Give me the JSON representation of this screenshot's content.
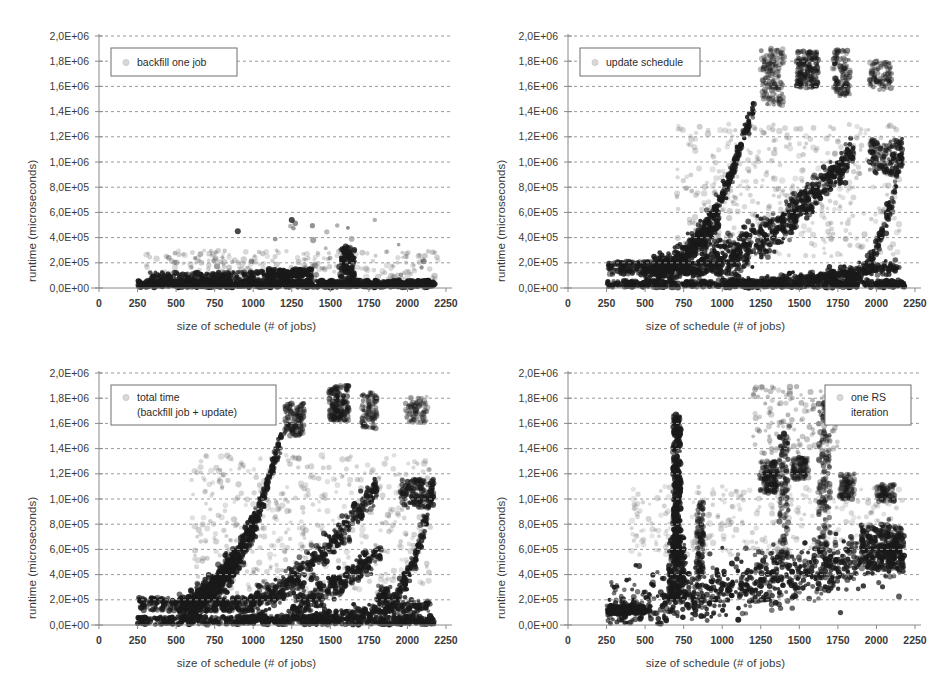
{
  "figure": {
    "panel_count": 4,
    "background": "#ffffff"
  },
  "axes": {
    "xlabel": "size of schedule (# of jobs)",
    "ylabel": "runtime (microseconds)",
    "x_ticks": [
      "0",
      "250",
      "500",
      "750",
      "1000",
      "1250",
      "1500",
      "1750",
      "2000",
      "2250"
    ],
    "x_tick_values": [
      0,
      250,
      500,
      750,
      1000,
      1250,
      1500,
      1750,
      2000,
      2250
    ],
    "y_ticks": [
      "0,0E+00",
      "2,0E+05",
      "4,0E+05",
      "6,0E+05",
      "8,0E+05",
      "1,0E+06",
      "1,2E+06",
      "1,4E+06",
      "1,6E+06",
      "1,8E+06",
      "2,0E+06"
    ],
    "y_tick_values": [
      0,
      200000,
      400000,
      600000,
      800000,
      1000000,
      1200000,
      1400000,
      1600000,
      1800000,
      2000000
    ],
    "xlim": [
      0,
      2250
    ],
    "ylim": [
      0,
      2000000
    ],
    "grid": "horizontal-dashed",
    "marker_color": "#1a1a1a",
    "grid_color": "#9a9a9a",
    "axis_color": "#8a8a8a"
  },
  "panels": [
    {
      "id": "backfill-one-job",
      "legend_lines": [
        "backfill one job"
      ],
      "legend_position": "top-left"
    },
    {
      "id": "update-schedule",
      "legend_lines": [
        "update schedule"
      ],
      "legend_position": "top-left"
    },
    {
      "id": "total-time",
      "legend_lines": [
        "total time",
        "(backfill job + update)"
      ],
      "legend_position": "top-left"
    },
    {
      "id": "one-rs-iteration",
      "legend_lines": [
        "one RS",
        "iteration"
      ],
      "legend_position": "top-right"
    }
  ],
  "chart_data": [
    {
      "type": "scatter",
      "id": "backfill-one-job",
      "title": "backfill one job",
      "xlabel": "size of schedule (# of jobs)",
      "ylabel": "runtime (microseconds)",
      "xlim": [
        0,
        2250
      ],
      "ylim": [
        0,
        2000000
      ],
      "grid": true,
      "legend": [
        "backfill one job"
      ],
      "legend_position": "top-left",
      "description": "Dense near-zero band of points from x=250 to x=2180 staying below 1.5E+05, with a sparse haze of outliers up to 3E+05 and isolated outliers at (900, 4.5E+05), (1250, 5.4E+05), (500, 1.2E+05); a denser vertical cluster near x=1600 reaching 3.3E+05.",
      "clusters": [
        {
          "name": "baseline-band",
          "x_range": [
            250,
            2180
          ],
          "y_range": [
            5000,
            60000
          ],
          "n": 900,
          "opacity": 0.95
        },
        {
          "name": "low-ridge",
          "x_range": [
            330,
            1350
          ],
          "y_range": [
            20000,
            130000
          ],
          "n": 320,
          "opacity": 0.85
        },
        {
          "name": "step-1250",
          "x_range": [
            1100,
            1380
          ],
          "y_range": [
            90000,
            150000
          ],
          "n": 120,
          "opacity": 0.9
        },
        {
          "name": "spike-1600",
          "x_range": [
            1560,
            1660
          ],
          "y_range": [
            60000,
            330000
          ],
          "n": 110,
          "opacity": 0.85
        },
        {
          "name": "haze",
          "x_range": [
            300,
            2200
          ],
          "y_range": [
            40000,
            300000
          ],
          "n": 260,
          "opacity": 0.22
        },
        {
          "name": "outliers",
          "x_range": [
            450,
            2150
          ],
          "y_range": [
            100000,
            560000
          ],
          "n": 26,
          "opacity": 0.5
        }
      ],
      "notable_points": [
        [
          900,
          450000
        ],
        [
          1250,
          540000
        ],
        [
          500,
          120000
        ],
        [
          1600,
          330000
        ]
      ]
    },
    {
      "type": "scatter",
      "id": "update-schedule",
      "title": "update schedule",
      "xlabel": "size of schedule (# of jobs)",
      "ylabel": "runtime (microseconds)",
      "xlim": [
        0,
        2250
      ],
      "ylim": [
        0,
        2000000
      ],
      "grid": true,
      "legend": [
        "update schedule"
      ],
      "legend_position": "top-left",
      "description": "Several rising curved ridges from x=250 upward. Steepest ridge climbs from (600,2E+05) to (1200,1.45E+06). A second ridge rises to 1.05E+06 near x=1800 then to 1.15E+06 at x=2150. A near-zero flat band runs the full width. Dense high-altitude clusters between 1.55E+06 and 1.9E+06 sit between x=1250 and x=2100.",
      "ridges": [
        {
          "name": "steep-ridge",
          "x0": 560,
          "y0": 150000,
          "x1": 1205,
          "y1": 1460000,
          "power": 2.1,
          "n": 340,
          "spread": 45000
        },
        {
          "name": "mid-ridge",
          "x0": 470,
          "y0": 120000,
          "x1": 1850,
          "y1": 1070000,
          "power": 1.8,
          "n": 420,
          "spread": 60000
        },
        {
          "name": "mid-ridge-2",
          "x0": 950,
          "y0": 150000,
          "x1": 1830,
          "y1": 1050000,
          "power": 1.5,
          "n": 300,
          "spread": 55000
        },
        {
          "name": "low-ridge",
          "x0": 560,
          "y0": 150000,
          "x1": 980,
          "y1": 530000,
          "power": 1.4,
          "n": 220,
          "spread": 40000
        },
        {
          "name": "tail-ridge",
          "x0": 1700,
          "y0": 60000,
          "x1": 2170,
          "y1": 1140000,
          "power": 3.2,
          "n": 180,
          "spread": 45000
        },
        {
          "name": "shallow-ridge",
          "x0": 1050,
          "y0": 30000,
          "x1": 2150,
          "y1": 170000,
          "power": 1.3,
          "n": 300,
          "spread": 25000
        }
      ],
      "clusters": [
        {
          "name": "baseline",
          "x_range": [
            250,
            2180
          ],
          "y_range": [
            3000,
            60000
          ],
          "n": 520,
          "opacity": 0.9
        },
        {
          "name": "plateau-200k",
          "x_range": [
            260,
            1000
          ],
          "y_range": [
            110000,
            210000
          ],
          "n": 260,
          "opacity": 0.8
        },
        {
          "name": "high-cluster-1300",
          "x_range": [
            1250,
            1400
          ],
          "y_range": [
            1450000,
            1900000
          ],
          "n": 140,
          "opacity": 0.45
        },
        {
          "name": "high-cluster-1550",
          "x_range": [
            1480,
            1620
          ],
          "y_range": [
            1580000,
            1880000
          ],
          "n": 150,
          "opacity": 0.6
        },
        {
          "name": "high-cluster-1780",
          "x_range": [
            1720,
            1830
          ],
          "y_range": [
            1520000,
            1900000
          ],
          "n": 110,
          "opacity": 0.5
        },
        {
          "name": "high-cluster-2000",
          "x_range": [
            1950,
            2100
          ],
          "y_range": [
            1570000,
            1800000
          ],
          "n": 90,
          "opacity": 0.45
        },
        {
          "name": "mid-haze",
          "x_range": [
            700,
            2150
          ],
          "y_range": [
            250000,
            1300000
          ],
          "n": 420,
          "opacity": 0.2
        },
        {
          "name": "cluster-2000-1e6",
          "x_range": [
            1950,
            2170
          ],
          "y_range": [
            900000,
            1180000
          ],
          "n": 120,
          "opacity": 0.75
        }
      ],
      "notable_points": [
        [
          1205,
          1460000
        ],
        [
          1830,
          1060000
        ],
        [
          2160,
          1150000
        ]
      ]
    },
    {
      "type": "scatter",
      "id": "total-time",
      "title": "total time (backfill job + update)",
      "xlabel": "size of schedule (# of jobs)",
      "ylabel": "runtime (microseconds)",
      "xlim": [
        0,
        2250
      ],
      "ylim": [
        0,
        2000000
      ],
      "grid": true,
      "legend": [
        "total time",
        "(backfill job + update)"
      ],
      "legend_position": "top-left",
      "description": "Similar to update schedule but shifted left and denser. Steep ridge climbs from (600,2E+05) to (1180,1.48E+06). Multiple intermediate ridges fan out between x=600 and x=1900 reaching 0.6E+06 to 1.1E+06. Flat near-zero band spans full width. High clusters between 1.6E+06 and 1.9E+06 appear at x=1250, 1500-1600, 1750 and 2000-2150.",
      "ridges": [
        {
          "name": "steep-ridge",
          "x0": 560,
          "y0": 160000,
          "x1": 1180,
          "y1": 1490000,
          "power": 2.2,
          "n": 360,
          "spread": 45000
        },
        {
          "name": "fan-a",
          "x0": 520,
          "y0": 130000,
          "x1": 1020,
          "y1": 830000,
          "power": 1.6,
          "n": 300,
          "spread": 55000
        },
        {
          "name": "fan-b",
          "x0": 600,
          "y0": 150000,
          "x1": 900,
          "y1": 560000,
          "power": 1.4,
          "n": 240,
          "spread": 45000
        },
        {
          "name": "fan-c",
          "x0": 980,
          "y0": 180000,
          "x1": 1800,
          "y1": 1080000,
          "power": 1.5,
          "n": 380,
          "spread": 60000
        },
        {
          "name": "fan-d",
          "x0": 1250,
          "y0": 150000,
          "x1": 1830,
          "y1": 600000,
          "power": 1.4,
          "n": 260,
          "spread": 50000
        },
        {
          "name": "tail-ridge",
          "x0": 1800,
          "y0": 200000,
          "x1": 2170,
          "y1": 1130000,
          "power": 2.6,
          "n": 170,
          "spread": 45000
        },
        {
          "name": "shallow-ridge",
          "x0": 900,
          "y0": 30000,
          "x1": 2150,
          "y1": 160000,
          "power": 1.3,
          "n": 320,
          "spread": 25000
        }
      ],
      "clusters": [
        {
          "name": "baseline",
          "x_range": [
            250,
            2180
          ],
          "y_range": [
            3000,
            70000
          ],
          "n": 500,
          "opacity": 0.9
        },
        {
          "name": "plateau-200k",
          "x_range": [
            260,
            1000
          ],
          "y_range": [
            110000,
            220000
          ],
          "n": 280,
          "opacity": 0.8
        },
        {
          "name": "high-cluster-1250",
          "x_range": [
            1200,
            1330
          ],
          "y_range": [
            1500000,
            1760000
          ],
          "n": 130,
          "opacity": 0.5
        },
        {
          "name": "high-cluster-1560",
          "x_range": [
            1490,
            1620
          ],
          "y_range": [
            1620000,
            1900000
          ],
          "n": 150,
          "opacity": 0.6
        },
        {
          "name": "high-cluster-1750",
          "x_range": [
            1700,
            1800
          ],
          "y_range": [
            1560000,
            1850000
          ],
          "n": 100,
          "opacity": 0.45
        },
        {
          "name": "high-cluster-2050",
          "x_range": [
            1980,
            2130
          ],
          "y_range": [
            1600000,
            1820000
          ],
          "n": 80,
          "opacity": 0.4
        },
        {
          "name": "mid-haze",
          "x_range": [
            600,
            2150
          ],
          "y_range": [
            250000,
            1350000
          ],
          "n": 460,
          "opacity": 0.2
        },
        {
          "name": "cluster-2000-1e6",
          "x_range": [
            1950,
            2170
          ],
          "y_range": [
            930000,
            1160000
          ],
          "n": 120,
          "opacity": 0.75
        }
      ],
      "notable_points": [
        [
          1180,
          1490000
        ],
        [
          1800,
          1080000
        ],
        [
          2160,
          1140000
        ]
      ]
    },
    {
      "type": "scatter",
      "id": "one-rs-iteration",
      "title": "one RS iteration",
      "xlabel": "size of schedule (# of jobs)",
      "ylabel": "runtime (microseconds)",
      "xlim": [
        0,
        2250
      ],
      "ylim": [
        0,
        2000000
      ],
      "grid": true,
      "legend": [
        "one RS",
        "iteration"
      ],
      "legend_position": "top-right",
      "description": "A broad elevated band between 2E+05 and 6E+05 spanning x=250 to x=2180, slowly trending upward. A striking narrow vertical spike at x=700 rises from 5E+05 to 1.67E+06. Additional vertical columns near x=850, x=1400 and x=1650-1700 reach 1.0E+06 to 1.3E+06. Scattered high outliers up to 1.9E+06 between x=1250 and x=1700.",
      "ridges": [
        {
          "name": "main-band",
          "x0": 250,
          "y0": 110000,
          "x1": 2180,
          "y1": 600000,
          "power": 1.15,
          "n": 900,
          "spread": 110000
        }
      ],
      "clusters": [
        {
          "name": "left-flat",
          "x_range": [
            250,
            500
          ],
          "y_range": [
            90000,
            150000
          ],
          "n": 180,
          "opacity": 0.9
        },
        {
          "name": "spike-700",
          "x_range": [
            680,
            730
          ],
          "y_range": [
            480000,
            1670000
          ],
          "n": 320,
          "opacity": 0.85
        },
        {
          "name": "spike-700-base",
          "x_range": [
            650,
            760
          ],
          "y_range": [
            200000,
            700000
          ],
          "n": 200,
          "opacity": 0.8
        },
        {
          "name": "column-850",
          "x_range": [
            830,
            880
          ],
          "y_range": [
            350000,
            980000
          ],
          "n": 90,
          "opacity": 0.7
        },
        {
          "name": "column-1400",
          "x_range": [
            1370,
            1430
          ],
          "y_range": [
            500000,
            1520000
          ],
          "n": 120,
          "opacity": 0.6
        },
        {
          "name": "column-1650",
          "x_range": [
            1620,
            1700
          ],
          "y_range": [
            600000,
            1760000
          ],
          "n": 140,
          "opacity": 0.55
        },
        {
          "name": "cluster-1300",
          "x_range": [
            1240,
            1360
          ],
          "y_range": [
            1050000,
            1300000
          ],
          "n": 130,
          "opacity": 0.6
        },
        {
          "name": "cluster-1500",
          "x_range": [
            1450,
            1560
          ],
          "y_range": [
            1150000,
            1330000
          ],
          "n": 100,
          "opacity": 0.55
        },
        {
          "name": "cluster-1800",
          "x_range": [
            1760,
            1860
          ],
          "y_range": [
            1000000,
            1200000
          ],
          "n": 90,
          "opacity": 0.5
        },
        {
          "name": "cluster-2050",
          "x_range": [
            2000,
            2120
          ],
          "y_range": [
            980000,
            1120000
          ],
          "n": 80,
          "opacity": 0.5
        },
        {
          "name": "rise-tail",
          "x_range": [
            1900,
            2180
          ],
          "y_range": [
            450000,
            800000
          ],
          "n": 220,
          "opacity": 0.8
        },
        {
          "name": "high-haze",
          "x_range": [
            1200,
            1750
          ],
          "y_range": [
            1350000,
            1900000
          ],
          "n": 120,
          "opacity": 0.3
        },
        {
          "name": "mid-haze",
          "x_range": [
            400,
            2180
          ],
          "y_range": [
            550000,
            1100000
          ],
          "n": 300,
          "opacity": 0.18
        }
      ],
      "notable_points": [
        [
          700,
          1670000
        ],
        [
          1400,
          1520000
        ],
        [
          1660,
          1760000
        ]
      ]
    }
  ]
}
